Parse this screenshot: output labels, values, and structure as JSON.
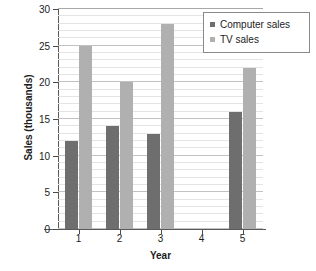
{
  "chart_data": {
    "type": "bar",
    "title": "",
    "xlabel": "Year",
    "ylabel": "Sales (thousands)",
    "categories": [
      "1",
      "2",
      "3",
      "4",
      "5"
    ],
    "series": [
      {
        "name": "Computer sales",
        "color": "#6e6e6e",
        "values": [
          12,
          14,
          13,
          0,
          16
        ]
      },
      {
        "name": "TV sales",
        "color": "#b0b0b0",
        "values": [
          25,
          20,
          28,
          0,
          22
        ]
      }
    ],
    "ylim": [
      0,
      30
    ],
    "y_major_ticks": [
      0,
      5,
      10,
      15,
      20,
      25,
      30
    ],
    "y_tick_labels": [
      "0",
      "5",
      "10",
      "15",
      "20",
      "25",
      "30"
    ],
    "y_minor_step": 1,
    "grid": true,
    "legend_position": "top-right",
    "background": "#ffffff"
  },
  "legend": {
    "items": [
      {
        "label": "Computer sales"
      },
      {
        "label": "TV sales"
      }
    ]
  },
  "axes": {
    "y_title": "Sales (thousands)",
    "x_title": "Year"
  }
}
